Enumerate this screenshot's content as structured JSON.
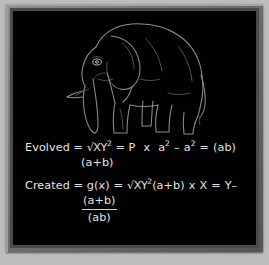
{
  "artwork": {
    "subject": "elephant-line-drawing",
    "style": "chalk-line-art",
    "board_color": "#010101",
    "chalk_color": "#8d8d8d",
    "frame_color": "#6e6e6e",
    "mat_color": "#bdbdbd"
  },
  "equations": {
    "first": {
      "label": "Evolved",
      "line": "Evolved =  √XY2 = P  x  a2 – a2 = (ab)",
      "prefix": "Evolved = ",
      "radical": "√XY",
      "exp1": "2",
      "mid": " = P",
      "times1": "x",
      "term_a": "a",
      "exp2": "2",
      "minus": "–",
      "term_b": "a",
      "exp3": "2",
      "equals": "=",
      "result": "(ab)",
      "sub": "(a+b)"
    },
    "second": {
      "label": "Created",
      "line": "Created = g(x) = √XY2(a+b) x X = Y–",
      "prefix": "Created = ",
      "func": "g(x)",
      "eq1": "=",
      "radical": "√XY",
      "exp1": "2",
      "group": "(a+b)",
      "times": "x",
      "var_x": "X",
      "eq2": "=",
      "var_y": "Y–",
      "fraction_numerator": "(a+b)",
      "fraction_denominator": "(ab)"
    }
  }
}
